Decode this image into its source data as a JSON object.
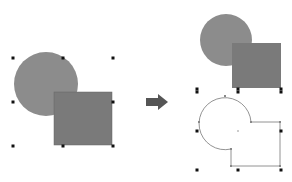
{
  "diagram": {
    "colors": {
      "circle_fill": "#8c8c8c",
      "square_fill": "#7a7a7a",
      "handle": "#111111",
      "outline": "#777777",
      "arrow": "#555555"
    },
    "before": {
      "circle": {
        "cx": 46,
        "cy": 84,
        "r": 32
      },
      "square": {
        "x": 54,
        "y": 92,
        "w": 58,
        "h": 53
      },
      "handles": [
        [
          13,
          58
        ],
        [
          63,
          58
        ],
        [
          113,
          58
        ],
        [
          13,
          102
        ],
        [
          113,
          102
        ],
        [
          13,
          146
        ],
        [
          63,
          146
        ],
        [
          113,
          146
        ]
      ]
    },
    "arrow": {
      "direction": "right"
    },
    "after_original": {
      "circle": {
        "cx": 226,
        "cy": 40,
        "r": 26
      },
      "square": {
        "x": 232,
        "y": 43,
        "w": 49,
        "h": 45
      },
      "handles": [
        [
          197,
          89
        ],
        [
          238,
          89
        ],
        [
          281,
          89
        ]
      ]
    },
    "after_union": {
      "handles": [
        [
          197,
          92
        ],
        [
          238,
          92
        ],
        [
          281,
          92
        ],
        [
          197,
          131
        ],
        [
          281,
          131
        ],
        [
          197,
          170
        ],
        [
          238,
          170
        ],
        [
          281,
          170
        ]
      ],
      "center_mark": [
        238,
        131
      ]
    }
  }
}
